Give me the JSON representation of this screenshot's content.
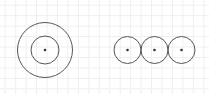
{
  "canvas": {
    "width": 209,
    "height": 94,
    "background": "#ffffff"
  },
  "grid": {
    "spacing": 10.45,
    "color": "#efefef"
  },
  "colors": {
    "stroke": "#555555",
    "dot": "#333333"
  },
  "figures": {
    "concentric": {
      "center": [
        45,
        50
      ],
      "outer_radius": 27.5,
      "inner_radius": 14,
      "dot_radius": 1.3
    },
    "row": {
      "circles": [
        {
          "center": [
            127.5,
            50
          ],
          "radius": 13.5
        },
        {
          "center": [
            154.5,
            50
          ],
          "radius": 13.5
        },
        {
          "center": [
            181.5,
            50
          ],
          "radius": 13.5
        }
      ],
      "dot_radius": 1.3
    }
  }
}
